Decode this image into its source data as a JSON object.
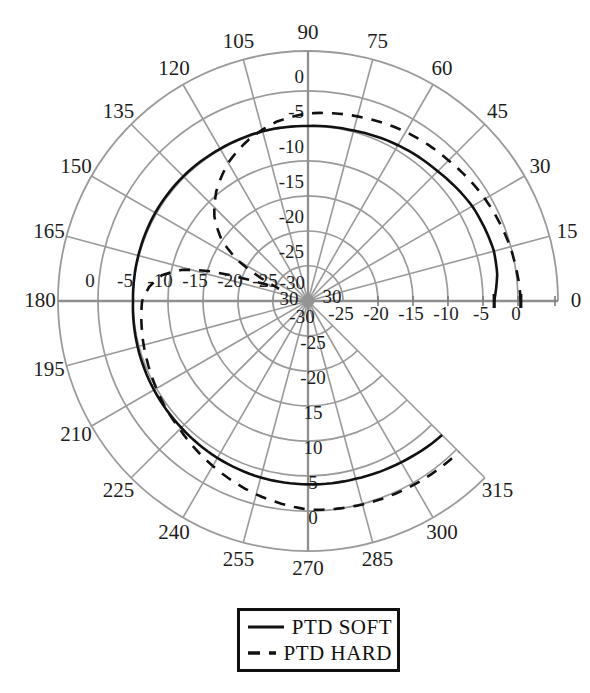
{
  "figure": {
    "background_color": "#ffffff",
    "grid_color": "#9a9a9a",
    "axis_color": "#8f8f8f",
    "label_color": "#1d1d1d",
    "curve_color": "#111111"
  },
  "legend": {
    "items": [
      {
        "label": "PTD SOFT",
        "style": "solid"
      },
      {
        "label": "PTD HARD",
        "style": "dashed"
      }
    ]
  },
  "chart_data": {
    "type": "line",
    "coordinate_system": "polar",
    "title": "",
    "angle_unit": "degrees",
    "radius_unit": "dB",
    "angle_range": [
      0,
      315
    ],
    "radial_axis": {
      "min": -30,
      "max": 0,
      "tick_step": 5,
      "grid_db": [
        0,
        -5,
        -10,
        -15,
        -20,
        -25
      ]
    },
    "angular_ticks": [
      0,
      15,
      30,
      45,
      60,
      75,
      90,
      105,
      120,
      135,
      150,
      165,
      180,
      195,
      210,
      225,
      240,
      255,
      270,
      285,
      300,
      315
    ],
    "angular_tick_labels": [
      "0",
      "15",
      "30",
      "45",
      "60",
      "75",
      "90",
      "105",
      "120",
      "135",
      "150",
      "165",
      "180",
      "195",
      "210",
      "225",
      "240",
      "255",
      "270",
      "285",
      "300",
      "315"
    ],
    "radial_labels": {
      "top": [
        {
          "text": "0",
          "db": 0
        },
        {
          "text": "-5",
          "db": -5
        },
        {
          "text": "-10",
          "db": -10
        },
        {
          "text": "-15",
          "db": -15
        },
        {
          "text": "-20",
          "db": -20
        },
        {
          "text": "-25",
          "db": -25
        },
        {
          "text": "-30",
          "db": -30
        }
      ],
      "left": [
        {
          "text": "0",
          "db": 0
        },
        {
          "text": "-5",
          "db": -5
        },
        {
          "text": "-10",
          "db": -10
        },
        {
          "text": "-15",
          "db": -15
        },
        {
          "text": "-20",
          "db": -20
        },
        {
          "text": "-25",
          "db": -25
        },
        {
          "text": "30",
          "db": -30
        }
      ],
      "right": [
        {
          "text": "30",
          "db": -30
        },
        {
          "text": "-25",
          "db": -25
        },
        {
          "text": "-20",
          "db": -20
        },
        {
          "text": "-15",
          "db": -15
        },
        {
          "text": "-10",
          "db": -10
        },
        {
          "text": "-5",
          "db": -5
        },
        {
          "text": "0",
          "db": 0
        }
      ],
      "bottom": [
        {
          "text": "-30",
          "db": -30
        },
        {
          "text": "-25",
          "db": -25
        },
        {
          "text": "-20",
          "db": -20
        },
        {
          "text": "15",
          "db": -15
        },
        {
          "text": "10",
          "db": -10
        },
        {
          "text": "5",
          "db": -5
        },
        {
          "text": "0",
          "db": 0
        }
      ]
    },
    "series": [
      {
        "name": "PTD SOFT",
        "style": "solid",
        "color": "#111111",
        "points": [
          [
            0,
            -3.4
          ],
          [
            8,
            -2.7
          ],
          [
            15,
            -2.5
          ],
          [
            30,
            -2.9
          ],
          [
            45,
            -3.8
          ],
          [
            60,
            -4.3
          ],
          [
            75,
            -4.8
          ],
          [
            90,
            -5.0
          ],
          [
            105,
            -4.9
          ],
          [
            120,
            -4.9
          ],
          [
            135,
            -4.8
          ],
          [
            150,
            -4.8
          ],
          [
            165,
            -4.9
          ],
          [
            180,
            -5.0
          ],
          [
            195,
            -4.8
          ],
          [
            210,
            -4.6
          ],
          [
            225,
            -4.4
          ],
          [
            240,
            -4.1
          ],
          [
            255,
            -3.9
          ],
          [
            270,
            -3.8
          ],
          [
            285,
            -3.7
          ],
          [
            300,
            -3.4
          ],
          [
            315,
            -2.9
          ]
        ]
      },
      {
        "name": "PTD HARD",
        "style": "dashed",
        "color": "#111111",
        "points": [
          [
            0,
            0.4
          ],
          [
            15,
            -0.1
          ],
          [
            30,
            -0.8
          ],
          [
            45,
            -1.6
          ],
          [
            60,
            -2.1
          ],
          [
            75,
            -2.7
          ],
          [
            90,
            -3.2
          ],
          [
            100,
            -4.0
          ],
          [
            110,
            -5.4
          ],
          [
            120,
            -7.2
          ],
          [
            130,
            -9.6
          ],
          [
            138,
            -12.0
          ],
          [
            145,
            -15.0
          ],
          [
            150,
            -18.5
          ],
          [
            154,
            -22.5
          ],
          [
            157,
            -25.5
          ],
          [
            160,
            -21.5
          ],
          [
            163,
            -15.5
          ],
          [
            166,
            -11.5
          ],
          [
            170,
            -8.8
          ],
          [
            175,
            -7.2
          ],
          [
            180,
            -6.3
          ],
          [
            190,
            -5.9
          ],
          [
            200,
            -5.5
          ],
          [
            210,
            -5.0
          ],
          [
            225,
            -4.1
          ],
          [
            240,
            -2.8
          ],
          [
            255,
            -1.4
          ],
          [
            270,
            -0.2
          ],
          [
            285,
            0.1
          ],
          [
            300,
            0.3
          ],
          [
            315,
            0.5
          ]
        ]
      }
    ],
    "layout": {
      "cx": 308,
      "cy": 301,
      "zero_db_radius": 210,
      "px_per_5db": 35,
      "rim_radius": 250,
      "angle_label_radius": 268,
      "sector_deg": 315,
      "axis_tick_radii": [
        70,
        105,
        140,
        175,
        210,
        247
      ]
    }
  }
}
